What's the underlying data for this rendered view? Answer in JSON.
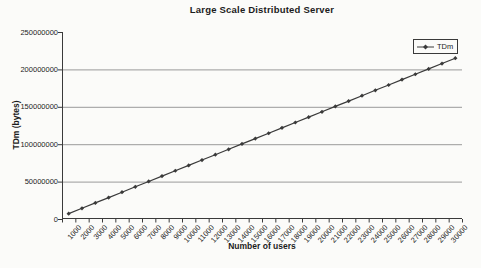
{
  "page": {
    "background": "#fbfbf9"
  },
  "chart_data": {
    "type": "line",
    "title": "Large Scale Distributed Server",
    "xlabel": "Number of users",
    "ylabel": "TDm (bytes)",
    "x": [
      1000,
      2000,
      3000,
      4000,
      5000,
      6000,
      7000,
      8000,
      9000,
      10000,
      11000,
      12000,
      13000,
      14000,
      15000,
      16000,
      17000,
      18000,
      19000,
      20000,
      21000,
      22000,
      23000,
      24000,
      25000,
      26000,
      27000,
      28000,
      29000,
      30000
    ],
    "xticklabels": [
      "1000",
      "2000",
      "3000",
      "4000",
      "5000",
      "6000",
      "7000",
      "8000",
      "9000",
      "10000",
      "11000",
      "12000",
      "13000",
      "14000",
      "15000",
      "16000",
      "17000",
      "18000",
      "19000",
      "20000",
      "21000",
      "22000",
      "23000",
      "24000",
      "25000",
      "26000",
      "27000",
      "28000",
      "29000",
      "30000"
    ],
    "ytick_values": [
      0,
      50000000,
      100000000,
      150000000,
      200000000,
      250000000
    ],
    "yticklabels": [
      "0",
      "50000000",
      "100000000",
      "150000000",
      "200000000",
      "250000000"
    ],
    "ylim": [
      0,
      250000000
    ],
    "grid": "horizontal",
    "legend": {
      "position": "top-right",
      "entries": [
        "TDm"
      ]
    },
    "series": [
      {
        "name": "TDm",
        "marker": "diamond",
        "values": [
          7167000,
          14334000,
          21501000,
          28668000,
          35835000,
          43002000,
          50169000,
          57336000,
          64503000,
          71670000,
          78837000,
          86004000,
          93171000,
          100338000,
          107505000,
          114672000,
          121839000,
          129006000,
          136173000,
          143340000,
          150507000,
          157674000,
          164841000,
          172008000,
          179175000,
          186342000,
          193509000,
          200676000,
          207843000,
          215010000
        ]
      }
    ],
    "colors": {
      "line": "#3a3a3a",
      "grid": "#9a9a9a",
      "axis": "#3a3a3a",
      "text": "#1c1c1c",
      "background": "#fbfbf9"
    }
  }
}
